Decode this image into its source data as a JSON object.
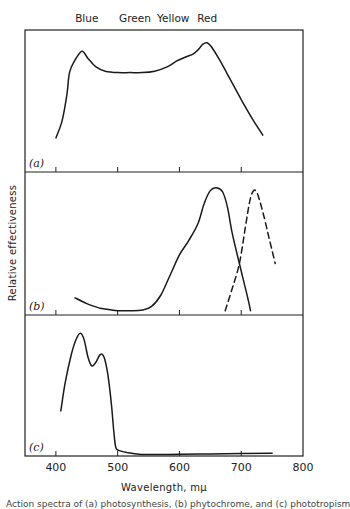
{
  "chart_data": {
    "type": "line",
    "title": "",
    "xlabel": "Wavelength, mμ",
    "ylabel": "Relative effectiveness",
    "xlim": [
      350,
      800
    ],
    "xticks": [
      400,
      500,
      600,
      700,
      800
    ],
    "xtick_labels": [
      "400",
      "500",
      "600",
      "700",
      "800"
    ],
    "grid": false,
    "legend": null,
    "color_band_labels": [
      {
        "label": "Blue",
        "nm": 450
      },
      {
        "label": "Green",
        "nm": 528
      },
      {
        "label": "Yellow",
        "nm": 590
      },
      {
        "label": "Red",
        "nm": 645
      }
    ],
    "panels": [
      {
        "label": "(a)",
        "ylim": [
          0,
          1
        ],
        "series": [
          {
            "name": "curve-a",
            "style": "solid",
            "x": [
              400,
              410,
              418,
              422,
              430,
              442,
              452,
              465,
              480,
              500,
              520,
              540,
              560,
              580,
              595,
              610,
              622,
              630,
              638,
              645,
              652,
              665,
              680,
              700,
              720,
              735
            ],
            "y": [
              0.24,
              0.36,
              0.55,
              0.7,
              0.78,
              0.85,
              0.8,
              0.74,
              0.71,
              0.7,
              0.7,
              0.7,
              0.71,
              0.74,
              0.78,
              0.81,
              0.83,
              0.86,
              0.9,
              0.91,
              0.88,
              0.79,
              0.67,
              0.51,
              0.36,
              0.26
            ]
          }
        ]
      },
      {
        "label": "(b)",
        "ylim": [
          0,
          1
        ],
        "series": [
          {
            "name": "curve-b-solid",
            "style": "solid",
            "x": [
              431,
              450,
              470,
              490,
              500,
              520,
              540,
              555,
              570,
              585,
              600,
              615,
              630,
              640,
              650,
              660,
              670,
              678,
              685,
              697,
              710,
              715
            ],
            "y": [
              0.12,
              0.08,
              0.05,
              0.035,
              0.03,
              0.03,
              0.035,
              0.06,
              0.14,
              0.28,
              0.42,
              0.52,
              0.64,
              0.78,
              0.87,
              0.89,
              0.86,
              0.75,
              0.58,
              0.36,
              0.13,
              0.03
            ]
          },
          {
            "name": "curve-b-dashed",
            "style": "dashed",
            "x": [
              674,
              685,
              697,
              707,
              714,
              720,
              726,
              735,
              745,
              755
            ],
            "y": [
              0.03,
              0.18,
              0.36,
              0.62,
              0.8,
              0.87,
              0.85,
              0.72,
              0.54,
              0.36
            ]
          }
        ]
      },
      {
        "label": "(c)",
        "ylim": [
          0,
          1
        ],
        "series": [
          {
            "name": "curve-c",
            "style": "solid",
            "x": [
              408,
              415,
              425,
              433,
              440,
              446,
              452,
              458,
              464,
              472,
              478,
              484,
              490,
              494,
              497,
              502,
              515,
              535,
              560,
              600,
              650,
              700,
              750
            ],
            "y": [
              0.32,
              0.52,
              0.72,
              0.83,
              0.87,
              0.82,
              0.7,
              0.64,
              0.66,
              0.72,
              0.7,
              0.58,
              0.36,
              0.16,
              0.06,
              0.04,
              0.025,
              0.012,
              0.01,
              0.012,
              0.015,
              0.018,
              0.02
            ]
          }
        ]
      }
    ]
  },
  "figure": {
    "caption_partial": "Action spectra of (a) photosynthesis, (b) phytochrome, and (c) phototropism"
  }
}
